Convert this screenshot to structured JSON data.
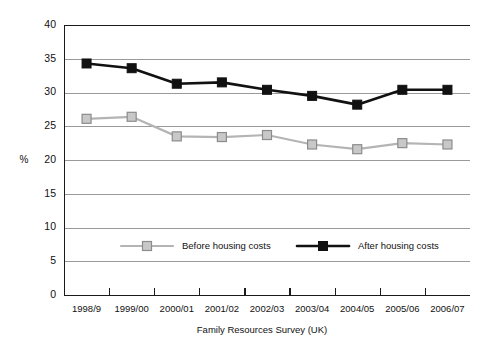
{
  "chart_data": {
    "type": "line",
    "title": "",
    "subtitle": "",
    "xlabel": "Family Resources Survey (UK)",
    "ylabel": "%",
    "categories": [
      "1998/9",
      "1999/00",
      "2000/01",
      "2001/02",
      "2002/03",
      "2003/04",
      "2004/05",
      "2005/06",
      "2006/07"
    ],
    "series": [
      {
        "name": "Before housing costs",
        "color": "#c8c8c8",
        "line_color": "#b4b4b4",
        "marker": "square",
        "values": [
          26.1,
          26.4,
          23.5,
          23.4,
          23.7,
          22.3,
          21.6,
          22.5,
          22.3
        ]
      },
      {
        "name": "After housing costs",
        "color": "#111111",
        "line_color": "#111111",
        "marker": "square",
        "values": [
          34.3,
          33.6,
          31.3,
          31.5,
          30.4,
          29.5,
          28.2,
          30.4,
          30.4
        ]
      }
    ],
    "ylim": [
      0,
      40
    ],
    "yticks": [
      0,
      5,
      10,
      15,
      20,
      25,
      30,
      35,
      40
    ],
    "ytick_labels": [
      "0",
      "5",
      "10",
      "15",
      "20",
      "25",
      "30",
      "35",
      "40"
    ],
    "grid": true,
    "grid_axis": "y",
    "legend_position": "inside-bottom-center",
    "legend": [
      "Before housing costs",
      "After housing costs"
    ]
  }
}
